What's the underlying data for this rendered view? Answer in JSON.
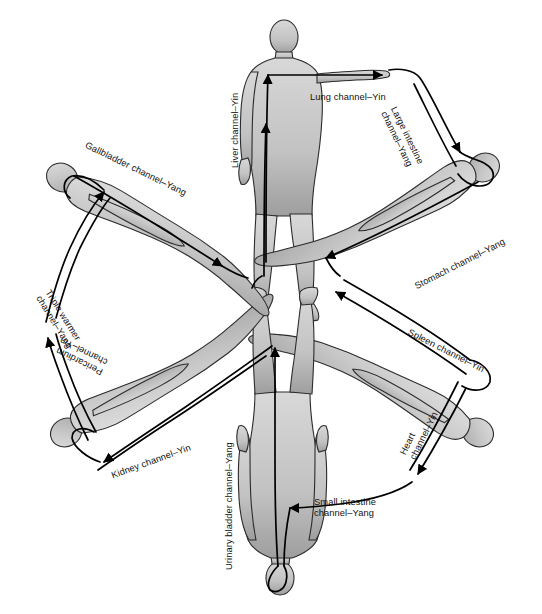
{
  "figure": {
    "type": "anatomical-diagram",
    "layout": "radial cycle of six human figures",
    "background_color": "#ffffff",
    "body_fill_color": "#c9c9c9",
    "body_outline_color": "#1a1a1a",
    "channel_line_color": "#000000"
  },
  "channels": [
    {
      "id": "lung",
      "label": "Lung channel–Yin",
      "organ": "Lung",
      "polarity": "Yin",
      "x": 310,
      "y": 92,
      "rotation": 0,
      "align": "left"
    },
    {
      "id": "large-intestine",
      "label": "Large intestine\nchannel–Yang",
      "organ": "Large intestine",
      "polarity": "Yang",
      "x": 398,
      "y": 105,
      "rotation": 64,
      "align": "left"
    },
    {
      "id": "stomach",
      "label": "Stomach channel–Yang",
      "organ": "Stomach",
      "polarity": "Yang",
      "x": 413,
      "y": 282,
      "rotation": -27,
      "align": "left"
    },
    {
      "id": "spleen",
      "label": "Spleen channel–Yin",
      "organ": "Spleen",
      "polarity": "Yin",
      "x": 411,
      "y": 327,
      "rotation": 27,
      "align": "left"
    },
    {
      "id": "heart",
      "label": "Heart\nchannel–Yin",
      "organ": "Heart",
      "polarity": "Yin",
      "x": 398,
      "y": 452,
      "rotation": -64,
      "align": "left"
    },
    {
      "id": "small-intestine",
      "label": "Small intestine\nchannel–Yang",
      "organ": "Small intestine",
      "polarity": "Yang",
      "x": 314,
      "y": 497,
      "rotation": 0,
      "align": "left"
    },
    {
      "id": "urinary-bladder",
      "label": "Urinary bladder channel–Yang",
      "organ": "Urinary bladder",
      "polarity": "Yang",
      "x": 224,
      "y": 570,
      "rotation": -90,
      "align": "left"
    },
    {
      "id": "kidney",
      "label": "Kidney channel–Yin",
      "organ": "Kidney",
      "polarity": "Yin",
      "x": 110,
      "y": 471,
      "rotation": -20,
      "align": "left"
    },
    {
      "id": "pericardium",
      "label": "Pericardium\nchannel–Yin",
      "organ": "Pericardium",
      "polarity": "Yin",
      "x": 100,
      "y": 377,
      "rotation": 206,
      "align": "left"
    },
    {
      "id": "triple-warmer",
      "label": "Triple warmer\nchannel–Yang",
      "organ": "Triple warmer",
      "polarity": "Yang",
      "x": 52,
      "y": 288,
      "rotation": 58,
      "align": "left"
    },
    {
      "id": "gallbladder",
      "label": "Gallbladder channel–Yang",
      "organ": "Gallbladder",
      "polarity": "Yang",
      "x": 88,
      "y": 140,
      "rotation": 26,
      "align": "left"
    },
    {
      "id": "liver",
      "label": "Liver channel–Yin",
      "organ": "Liver",
      "polarity": "Yin",
      "x": 230,
      "y": 168,
      "rotation": -90,
      "align": "left"
    }
  ],
  "figures": [
    {
      "id": "standing-front",
      "position": "top-center",
      "orientation": "upright, anterior view"
    },
    {
      "id": "reclining-upper-right",
      "position": "upper-right",
      "orientation": "reclining, head to the right"
    },
    {
      "id": "reclining-lower-right",
      "position": "lower-right",
      "orientation": "reclining, head to the right"
    },
    {
      "id": "inverted-bottom",
      "position": "bottom-center",
      "orientation": "inverted, posterior view"
    },
    {
      "id": "reclining-lower-left",
      "position": "lower-left",
      "orientation": "reclining, head to the left"
    },
    {
      "id": "reclining-upper-left",
      "position": "upper-left",
      "orientation": "reclining, head to the left"
    }
  ]
}
